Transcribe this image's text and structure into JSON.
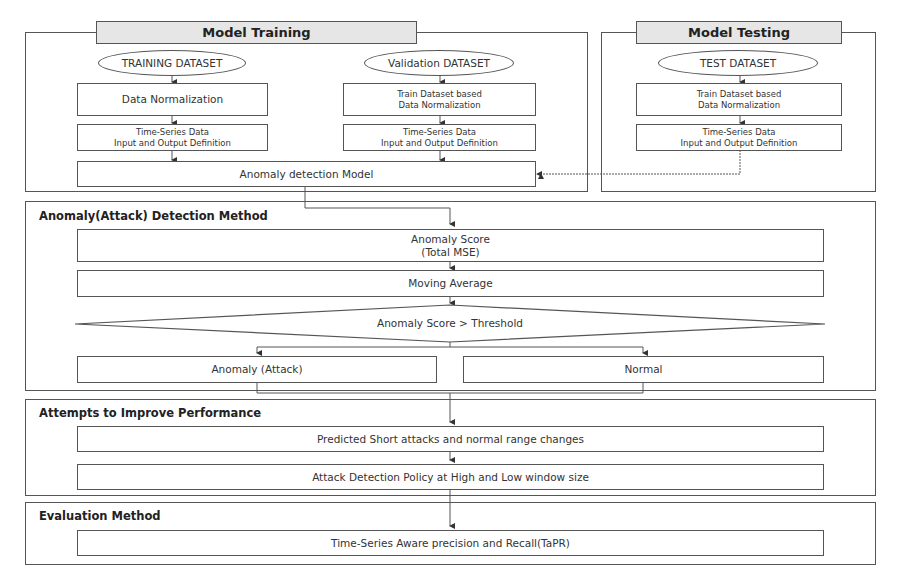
{
  "model_training": {
    "title": "Model Training",
    "training_dataset": "TRAINING DATASET",
    "validation_dataset": "Validation DATASET",
    "train_norm": "Data Normalization",
    "val_norm_l1": "Train Dataset based",
    "val_norm_l2": "Data Normalization",
    "ts_l1": "Time-Series Data",
    "ts_l2": "Input and Output Definition",
    "model": "Anomaly detection Model"
  },
  "model_testing": {
    "title": "Model Testing",
    "test_dataset": "TEST DATASET",
    "norm_l1": "Train Dataset based",
    "norm_l2": "Data Normalization",
    "ts_l1": "Time-Series Data",
    "ts_l2": "Input and Output Definition"
  },
  "detection": {
    "title": "Anomaly(Attack) Detection Method",
    "score_l1": "Anomaly Score",
    "score_l2": "(Total MSE)",
    "moving_average": "Moving Average",
    "decision": "Anomaly Score > Threshold",
    "anomaly": "Anomaly (Attack)",
    "normal": "Normal"
  },
  "improve": {
    "title": "Attempts to Improve Performance",
    "step1": "Predicted Short attacks and normal range changes",
    "step2": "Attack Detection Policy at High and Low window size"
  },
  "evaluation": {
    "title": "Evaluation Method",
    "step1": "Time-Series Aware precision and Recall(TaPR)"
  }
}
